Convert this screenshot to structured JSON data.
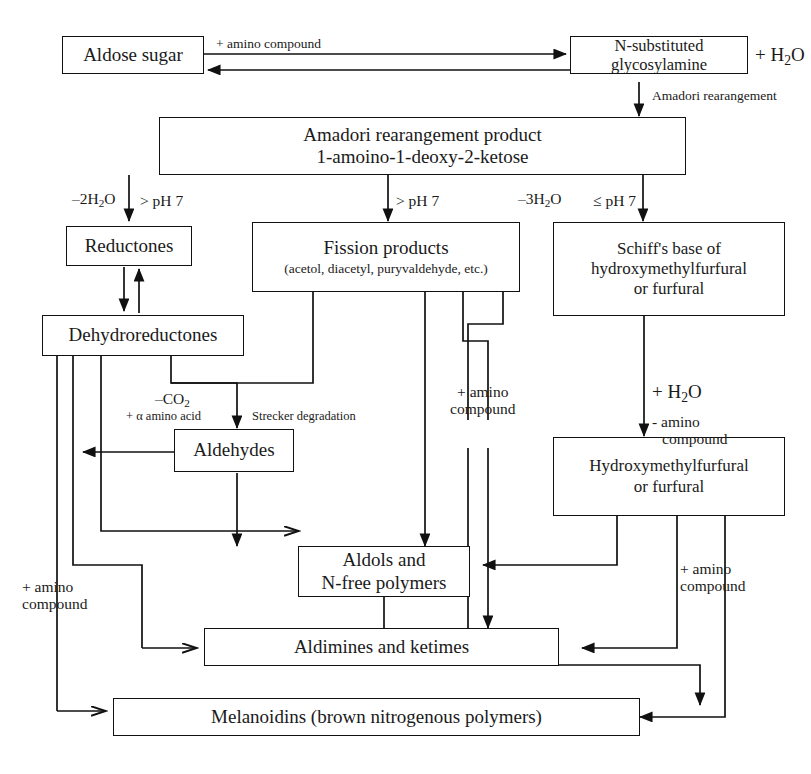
{
  "diagram": {
    "stroke_color": "#111111",
    "background": "#ffffff"
  },
  "nodes": {
    "aldose_sugar": "Aldose sugar",
    "n_substituted_glycosylamine": "N-substituted glycosylamine",
    "amadori_line1": "Amadori rearangement product",
    "amadori_line2": "1-amoino-1-deoxy-2-ketose",
    "reductones": "Reductones",
    "fission_products_line1": "Fission products",
    "fission_products_line2": "(acetol, diacetyl, puryvaldehyde, etc.)",
    "schiffs_base_line1": "Schiff's base of",
    "schiffs_base_line2": "hydroxymethylfurfural",
    "schiffs_base_line3": "or furfural",
    "dehydroreductones": "Dehydroreductones",
    "aldehydes": "Aldehydes",
    "hmf_line1": "Hydroxymethylfurfural",
    "hmf_line2": "or furfural",
    "aldols_line1": "Aldols and",
    "aldols_line2": "N-free polymers",
    "aldimines": "Aldimines and ketimes",
    "melanoidins": "Melanoidins (brown nitrogenous polymers)"
  },
  "edge_labels": {
    "amino_compound_top": "+ amino compound",
    "water_top_right": "+ H2O",
    "amadori_rearangement": "Amadori rearangement",
    "minus_2h2o": "–2H2O",
    "ph_gt7_left": "> pH 7",
    "ph_gt7_mid": "> pH 7",
    "minus_3h2o": "–3H2O",
    "ph_le7_right": "≤ pH 7",
    "minus_co2": "–CO2",
    "plus_alpha_amino_acid": "+ α amino acid",
    "strecker_degradation": "Strecker degradation",
    "plus_h2o_right": "+ H2O",
    "minus_amino_compound_line1": "- amino",
    "minus_amino_compound_line2": "compound",
    "amino_compound_center_line1": "+ amino",
    "amino_compound_center_line2": "compound",
    "amino_compound_left_line1": "+ amino",
    "amino_compound_left_line2": "compound",
    "amino_compound_right_line1": "+ amino",
    "amino_compound_right_line2": "compound"
  }
}
